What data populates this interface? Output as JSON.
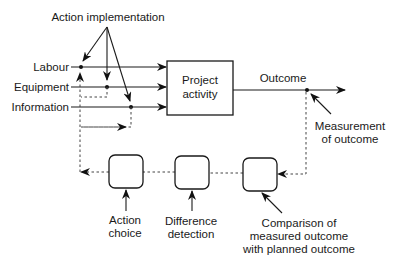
{
  "diagram": {
    "title_label": "Action implementation",
    "inputs": [
      {
        "label": "Labour"
      },
      {
        "label": "Equipment"
      },
      {
        "label": "Information"
      }
    ],
    "process_box": {
      "line1": "Project",
      "line2": "activity"
    },
    "output_label": "Outcome",
    "measurement_label": {
      "line1": "Measurement",
      "line2": "of outcome"
    },
    "control_boxes": [
      {
        "label_lines": [
          "Action",
          "choice"
        ]
      },
      {
        "label_lines": [
          "Difference",
          "detection"
        ]
      },
      {
        "label_lines": [
          "Comparison of",
          "measured outcome",
          "with planned outcome"
        ]
      }
    ]
  }
}
